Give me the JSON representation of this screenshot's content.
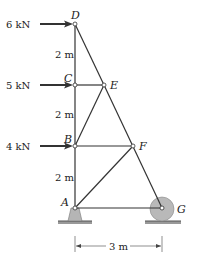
{
  "diagram": {
    "type": "truss",
    "nodes": {
      "A": {
        "label": "A",
        "x": 75,
        "y": 208
      },
      "B": {
        "label": "B",
        "x": 75,
        "y": 146
      },
      "C": {
        "label": "C",
        "x": 75,
        "y": 85
      },
      "D": {
        "label": "D",
        "x": 75,
        "y": 24
      },
      "E": {
        "label": "E",
        "x": 104,
        "y": 85
      },
      "F": {
        "label": "F",
        "x": 133,
        "y": 146
      },
      "G": {
        "label": "G",
        "x": 162,
        "y": 208
      }
    },
    "members": [
      "AB",
      "BC",
      "CD",
      "DE",
      "CE",
      "EB",
      "EF",
      "BF",
      "AF",
      "FG",
      "AG"
    ],
    "loads": [
      {
        "node": "D",
        "label": "6 kN"
      },
      {
        "node": "C",
        "label": "5 kN"
      },
      {
        "node": "B",
        "label": "4 kN"
      }
    ],
    "spacings": [
      {
        "label": "2 m",
        "between": "D-C"
      },
      {
        "label": "2 m",
        "between": "C-B"
      },
      {
        "label": "2 m",
        "between": "B-A"
      }
    ],
    "horizontal_dimension": {
      "label": "3 m",
      "between": "A-G"
    },
    "supports": {
      "A": "pin",
      "G": "roller"
    },
    "colors": {
      "member": "#333333",
      "support_fill": "#b5b5b5",
      "ground": "#888888"
    }
  }
}
